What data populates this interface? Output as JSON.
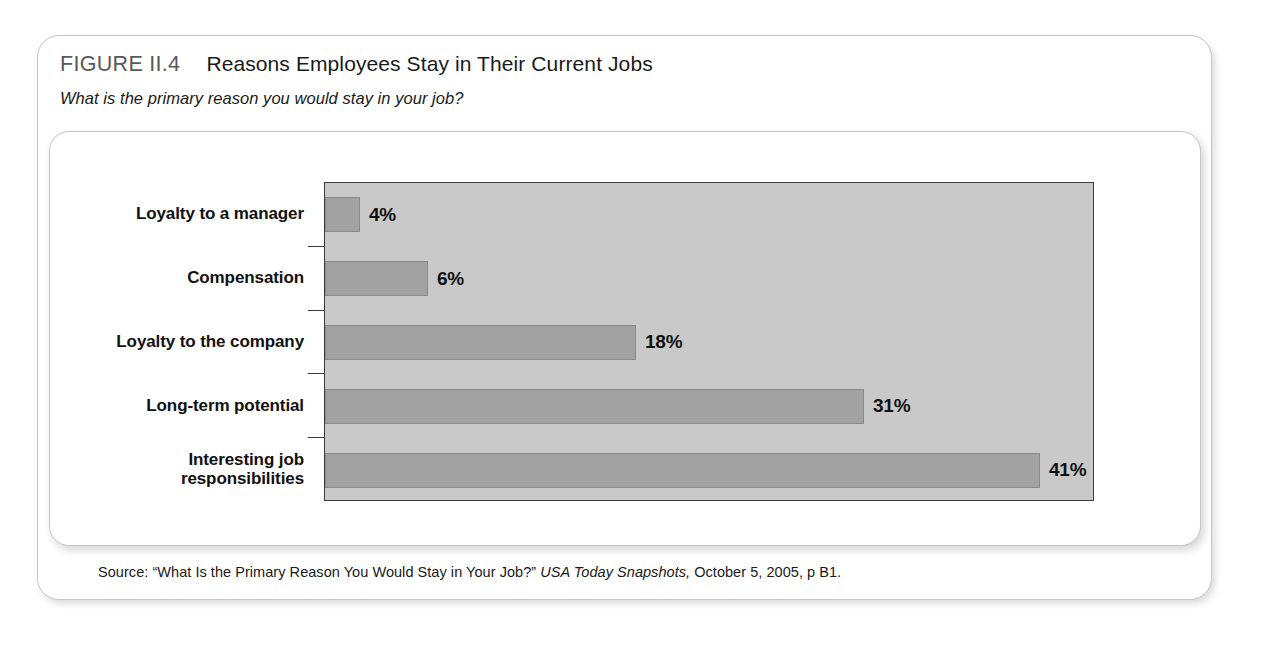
{
  "figure": {
    "number": "FIGURE II.4",
    "title": "Reasons Employees Stay in Their Current Jobs",
    "subtitle": "What is the primary reason you would stay in your job?"
  },
  "source": {
    "prefix": "Source: “What Is the Primary Reason You Would Stay in Your Job?” ",
    "publication": "USA Today Snapshots,",
    "suffix": " October 5, 2005, p B1."
  },
  "chart_data": {
    "type": "bar",
    "orientation": "horizontal",
    "title": "Reasons Employees Stay in Their Current Jobs",
    "subtitle": "What is the primary reason you would stay in your job?",
    "xlabel": "",
    "ylabel": "",
    "grid": false,
    "legend": false,
    "categories": [
      "Loyalty to a manager",
      "Compensation",
      "Loyalty to the company",
      "Long-term potential",
      "Interesting job responsibilities"
    ],
    "values": [
      4,
      6,
      18,
      31,
      41
    ],
    "value_labels": [
      "4%",
      "6%",
      "18%",
      "31%",
      "41%"
    ],
    "bar_pixel_widths": [
      35,
      103,
      311,
      539,
      715
    ],
    "xlim": [
      0,
      44
    ],
    "colors": {
      "bar_fill": "#a2a2a2",
      "bar_border": "#8a8a8a",
      "plot_background": "#c9c9c9",
      "axis": "#3c3c3c",
      "text": "#111111",
      "figure_number": "#58595b"
    }
  }
}
